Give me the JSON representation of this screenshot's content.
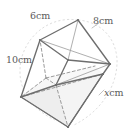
{
  "figure": {
    "shape": "cuboid",
    "projection": "tilted oblique",
    "colors": {
      "edge_visible": "#6e6e6e",
      "edge_hidden": "#8e8e8e",
      "edge_thin": "#9a9a9a",
      "face_shade": "#e9e9e9",
      "face_shade_light": "#f3f3f3",
      "arc_guide": "#c4c4c4",
      "label_text": "#5a5a5a",
      "background": "#ffffff"
    },
    "labels": [
      {
        "id": "top-left-edge",
        "text": "6 cm",
        "value": 6,
        "unit": "cm",
        "variable": false
      },
      {
        "id": "top-right-edge",
        "text": "8 cm",
        "value": 8,
        "unit": "cm",
        "variable": false
      },
      {
        "id": "left-vertical-edge",
        "text": "10 cm",
        "value": 10,
        "unit": "cm",
        "variable": false
      },
      {
        "id": "bottom-right-edge",
        "text": "x cm",
        "value": "x",
        "unit": "cm",
        "variable": true
      }
    ],
    "label_parts": {
      "six": "6",
      "eight": "8",
      "ten": "10",
      "ex": "x",
      "unit": "cm"
    }
  }
}
